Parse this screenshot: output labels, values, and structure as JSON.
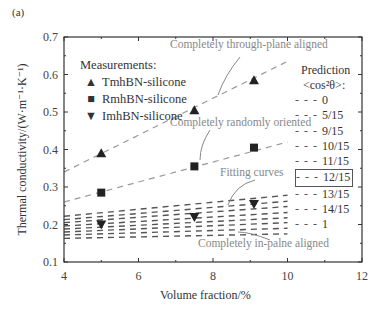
{
  "panel_label": "(a)",
  "chart_data": {
    "type": "scatter",
    "title": "",
    "xlabel": "Volume fraction/%",
    "ylabel": "Thermal conductivity/(W·m⁻¹·K⁻¹)",
    "xlim": [
      4,
      12
    ],
    "ylim": [
      0.1,
      0.7
    ],
    "xticks": [
      "4",
      "6",
      "8",
      "10",
      "12"
    ],
    "yticks": [
      "0.1",
      "0.2",
      "0.3",
      "0.4",
      "0.5",
      "0.6",
      "0.7"
    ],
    "grid": false,
    "measurements_title": "Measurements:",
    "series": [
      {
        "name": "TmhBN-silicone",
        "marker": "triangle-up",
        "x": [
          5,
          7.5,
          9.1
        ],
        "y": [
          0.39,
          0.505,
          0.585
        ]
      },
      {
        "name": "RmhBN-silicone",
        "marker": "square",
        "x": [
          5,
          7.5,
          9.1
        ],
        "y": [
          0.285,
          0.355,
          0.405
        ]
      },
      {
        "name": "ImhBN-silicone",
        "marker": "triangle-down",
        "x": [
          5,
          7.5,
          9.1
        ],
        "y": [
          0.2,
          0.22,
          0.255
        ]
      }
    ],
    "prediction_title": "Prediction",
    "prediction_subtitle": "<cos²θ>:",
    "predictions": [
      {
        "label": "0",
        "y_at_4": 0.163,
        "y_at_10": 0.175
      },
      {
        "label": "5/15",
        "y_at_4": 0.172,
        "y_at_10": 0.19
      },
      {
        "label": "9/15",
        "y_at_4": 0.18,
        "y_at_10": 0.205
      },
      {
        "label": "10/15",
        "y_at_4": 0.188,
        "y_at_10": 0.218
      },
      {
        "label": "11/15",
        "y_at_4": 0.196,
        "y_at_10": 0.232
      },
      {
        "label": "12/15",
        "y_at_4": 0.205,
        "y_at_10": 0.248
      },
      {
        "label": "13/15",
        "y_at_4": 0.213,
        "y_at_10": 0.262
      },
      {
        "label": "14/15",
        "y_at_4": 0.222,
        "y_at_10": 0.278
      },
      {
        "label": "1",
        "y_at_4": 0.26,
        "y_at_10": 0.42
      },
      {
        "label": "through-plane",
        "y_at_4": 0.34,
        "y_at_10": 0.635
      }
    ],
    "highlighted_prediction": "12/15",
    "annotations": [
      "Completely through-plane aligned",
      "Completely randomly oriented",
      "Fitting curves",
      "Completely in-palne aligned"
    ]
  }
}
